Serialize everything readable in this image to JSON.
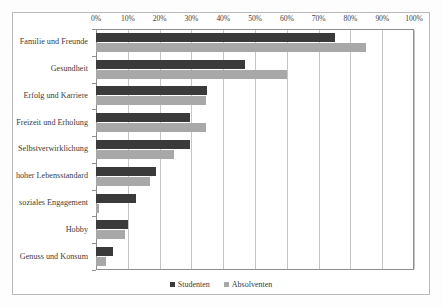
{
  "chart_data": {
    "type": "bar",
    "orientation": "horizontal",
    "title": "",
    "xlabel": "",
    "ylabel": "",
    "xlim": [
      0,
      100
    ],
    "xtick_labels": [
      "0%",
      "10%",
      "20%",
      "30%",
      "40%",
      "50%",
      "60%",
      "70%",
      "80%",
      "90%",
      "100%"
    ],
    "xtick_values": [
      0,
      10,
      20,
      30,
      40,
      50,
      60,
      70,
      80,
      90,
      100
    ],
    "grid": true,
    "legend_position": "bottom",
    "categories": [
      "Familie und Freunde",
      "Gesundheit",
      "Erfolg und Karriere",
      "Freizeit und Erholung",
      "Selbstverwirklichung",
      "hoher Lebensstandard",
      "soziales Engagement",
      "Hobby",
      "Genuss und Konsum"
    ],
    "series": [
      {
        "name": "Studenten",
        "color": "#3a3a3a",
        "values": [
          75,
          47,
          35,
          29.5,
          29.5,
          19,
          12.5,
          10,
          5.5
        ]
      },
      {
        "name": "Absolventen",
        "color": "#a8a8a8",
        "values": [
          85,
          60,
          34.5,
          34.5,
          24.5,
          17,
          1,
          9,
          3
        ]
      }
    ]
  }
}
